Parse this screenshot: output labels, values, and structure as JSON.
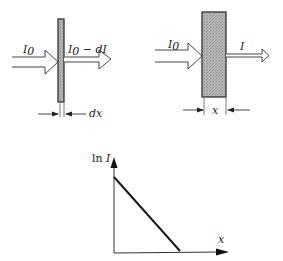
{
  "figure": {
    "panel_thin_slab": {
      "incident_label": "I",
      "incident_sub": "0",
      "transmitted_label": "I",
      "transmitted_sub": "0",
      "transmitted_suffix": " − dI",
      "thickness_label": "dx"
    },
    "panel_thick_slab": {
      "incident_label": "I",
      "incident_sub": "0",
      "transmitted_label": "I",
      "thickness_label": "x"
    },
    "graph": {
      "y_axis_prefix": "ln ",
      "y_axis_var": "I",
      "x_axis_label": "x"
    },
    "colors": {
      "slab_fill": "#a8a8a8",
      "slab_edge": "#333333",
      "line": "#1a1a1a"
    }
  }
}
